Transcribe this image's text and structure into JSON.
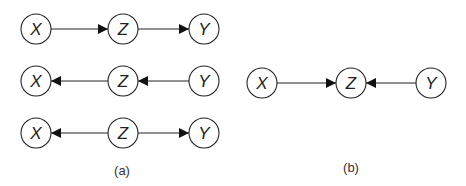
{
  "panels": [
    {
      "label": "(a)",
      "rows": [
        {
          "nodes": [
            "X",
            "Z",
            "Y"
          ],
          "edges": [
            {
              "from": "X",
              "to": "Z"
            },
            {
              "from": "Z",
              "to": "Y"
            }
          ],
          "type": "chain"
        },
        {
          "nodes": [
            "X",
            "Z",
            "Y"
          ],
          "edges": [
            {
              "from": "Z",
              "to": "X"
            },
            {
              "from": "Y",
              "to": "Z"
            }
          ],
          "type": "chain-reversed"
        },
        {
          "nodes": [
            "X",
            "Z",
            "Y"
          ],
          "edges": [
            {
              "from": "Z",
              "to": "X"
            },
            {
              "from": "Z",
              "to": "Y"
            }
          ],
          "type": "fork"
        }
      ]
    },
    {
      "label": "(b)",
      "rows": [
        {
          "nodes": [
            "X",
            "Z",
            "Y"
          ],
          "edges": [
            {
              "from": "X",
              "to": "Z"
            },
            {
              "from": "Y",
              "to": "Z"
            }
          ],
          "type": "collider"
        }
      ]
    }
  ]
}
